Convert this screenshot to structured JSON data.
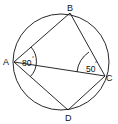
{
  "diagram": {
    "type": "cyclic-quadrilateral",
    "circle": {
      "cx": 61,
      "cy": 62,
      "r": 48
    },
    "points": {
      "A": {
        "label": "A",
        "x": 14,
        "y": 62
      },
      "B": {
        "label": "B",
        "x": 70,
        "y": 13
      },
      "C": {
        "label": "C",
        "x": 105,
        "y": 76
      },
      "D": {
        "label": "D",
        "x": 68,
        "y": 110
      }
    },
    "segments": [
      "AB",
      "BC",
      "CD",
      "DA",
      "AC"
    ],
    "angles": [
      {
        "vertex": "A",
        "value": "80",
        "unit": "°",
        "between": [
          "B",
          "D"
        ]
      },
      {
        "vertex": "C",
        "value": "50",
        "unit": "°",
        "between": [
          "B",
          "A"
        ]
      }
    ],
    "colors": {
      "stroke": "#111111",
      "background": "#ffffff"
    }
  }
}
